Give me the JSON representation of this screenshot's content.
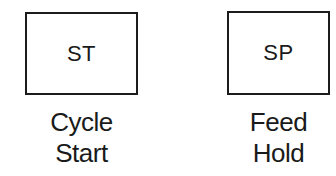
{
  "keys": [
    {
      "code": "ST",
      "label_line1": "Cycle",
      "label_line2": "Start"
    },
    {
      "code": "SP",
      "label_line1": "Feed",
      "label_line2": "Hold"
    }
  ]
}
